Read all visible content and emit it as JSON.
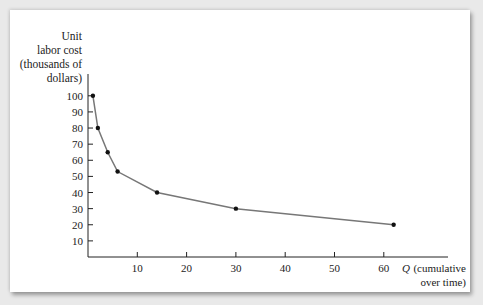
{
  "chart_data": {
    "type": "line",
    "title": "",
    "ylabel": "Unit labor cost (thousands of dollars)",
    "ylabel_lines": [
      "Unit",
      "labor cost",
      "(thousands of",
      "dollars)"
    ],
    "xlabel": "Q (cumulative over time)",
    "xlabel_lines": [
      "Q",
      "(cumulative",
      "over time)"
    ],
    "x": [
      1,
      2,
      4,
      6,
      14,
      30,
      62
    ],
    "values": [
      100,
      80,
      65,
      53,
      40,
      30,
      20
    ],
    "xlim": [
      0,
      70
    ],
    "ylim": [
      0,
      100
    ],
    "x_ticks": [
      "10",
      "20",
      "30",
      "40",
      "50",
      "60"
    ],
    "y_ticks": [
      "100",
      "90",
      "80",
      "70",
      "60",
      "50",
      "40",
      "30",
      "20",
      "10"
    ],
    "grid": false,
    "legend": null,
    "markers": true,
    "line_color": "#777777",
    "marker_color": "#111111"
  }
}
